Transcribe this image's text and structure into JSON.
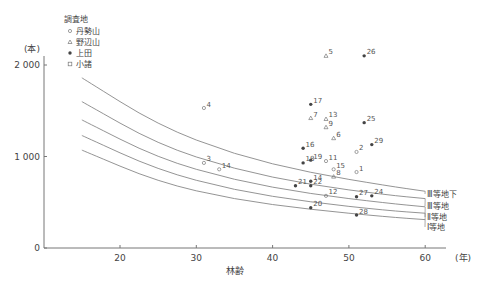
{
  "chart_data": {
    "type": "scatter",
    "title": "",
    "xlabel": "林齢",
    "x_unit": "(年)",
    "ylabel": "(本)",
    "xlim": [
      10,
      65
    ],
    "ylim": [
      0,
      2000
    ],
    "xticks": [
      20,
      30,
      40,
      50,
      60
    ],
    "yticks": [
      0,
      1000,
      2000
    ],
    "ytick_labels": [
      "0",
      "1 000",
      "2 000"
    ],
    "legend": {
      "title": "調査地",
      "entries": [
        {
          "name": "丹勢山",
          "marker": "circle-small"
        },
        {
          "name": "野辺山",
          "marker": "triangle"
        },
        {
          "name": "上田",
          "marker": "filled-dot"
        },
        {
          "name": "小諸",
          "marker": "square"
        }
      ]
    },
    "curves": [
      {
        "name": "",
        "points": [
          [
            15,
            1860
          ],
          [
            25,
            1340
          ],
          [
            35,
            1020
          ],
          [
            45,
            820
          ],
          [
            55,
            680
          ],
          [
            60,
            620
          ]
        ]
      },
      {
        "name": "Ⅲ等地下",
        "points": [
          [
            15,
            1600
          ],
          [
            25,
            1130
          ],
          [
            35,
            860
          ],
          [
            45,
            690
          ],
          [
            55,
            580
          ],
          [
            60,
            540
          ]
        ]
      },
      {
        "name": "Ⅲ等地",
        "points": [
          [
            15,
            1400
          ],
          [
            25,
            980
          ],
          [
            35,
            740
          ],
          [
            45,
            590
          ],
          [
            55,
            490
          ],
          [
            60,
            450
          ]
        ]
      },
      {
        "name": "Ⅱ等地",
        "points": [
          [
            15,
            1230
          ],
          [
            25,
            850
          ],
          [
            35,
            630
          ],
          [
            45,
            500
          ],
          [
            55,
            410
          ],
          [
            60,
            380
          ]
        ]
      },
      {
        "name": "Ⅰ等地",
        "points": [
          [
            15,
            1070
          ],
          [
            25,
            720
          ],
          [
            35,
            530
          ],
          [
            45,
            420
          ],
          [
            55,
            340
          ],
          [
            60,
            310
          ]
        ]
      }
    ],
    "points": [
      {
        "id": "4",
        "site": "丹勢山",
        "x": 31,
        "y": 1530
      },
      {
        "id": "3",
        "site": "丹勢山",
        "x": 31,
        "y": 930
      },
      {
        "id": "14",
        "site": "丹勢山",
        "x": 33,
        "y": 860
      },
      {
        "id": "5",
        "site": "野辺山",
        "x": 47,
        "y": 2100
      },
      {
        "id": "26",
        "site": "上田",
        "x": 52,
        "y": 2100
      },
      {
        "id": "17",
        "site": "上田",
        "x": 45,
        "y": 1570
      },
      {
        "id": "7",
        "site": "野辺山",
        "x": 45,
        "y": 1420
      },
      {
        "id": "13",
        "site": "野辺山",
        "x": 47,
        "y": 1410
      },
      {
        "id": "9",
        "site": "野辺山",
        "x": 47,
        "y": 1320
      },
      {
        "id": "25",
        "site": "上田",
        "x": 52,
        "y": 1370
      },
      {
        "id": "6",
        "site": "野辺山",
        "x": 48,
        "y": 1200
      },
      {
        "id": "16",
        "site": "上田",
        "x": 44,
        "y": 1090
      },
      {
        "id": "29",
        "site": "上田",
        "x": 53,
        "y": 1130
      },
      {
        "id": "2",
        "site": "丹勢山",
        "x": 51,
        "y": 1050
      },
      {
        "id": "19",
        "site": "上田",
        "x": 45,
        "y": 960
      },
      {
        "id": "18",
        "site": "上田",
        "x": 44,
        "y": 930
      },
      {
        "id": "11",
        "site": "丹勢山",
        "x": 47,
        "y": 950
      },
      {
        "id": "15",
        "site": "丹勢山",
        "x": 48,
        "y": 860
      },
      {
        "id": "1",
        "site": "丹勢山",
        "x": 51,
        "y": 830
      },
      {
        "id": "8",
        "site": "野辺山",
        "x": 48,
        "y": 780
      },
      {
        "id": "14",
        "site": "上田",
        "x": 45,
        "y": 730
      },
      {
        "id": "21",
        "site": "上田",
        "x": 43,
        "y": 680
      },
      {
        "id": "22",
        "site": "上田",
        "x": 45,
        "y": 680
      },
      {
        "id": "12",
        "site": "丹勢山",
        "x": 47,
        "y": 570
      },
      {
        "id": "27",
        "site": "上田",
        "x": 51,
        "y": 560
      },
      {
        "id": "24",
        "site": "上田",
        "x": 53,
        "y": 570
      },
      {
        "id": "20",
        "site": "上田",
        "x": 45,
        "y": 440
      },
      {
        "id": "28",
        "site": "上田",
        "x": 51,
        "y": 360
      }
    ]
  }
}
